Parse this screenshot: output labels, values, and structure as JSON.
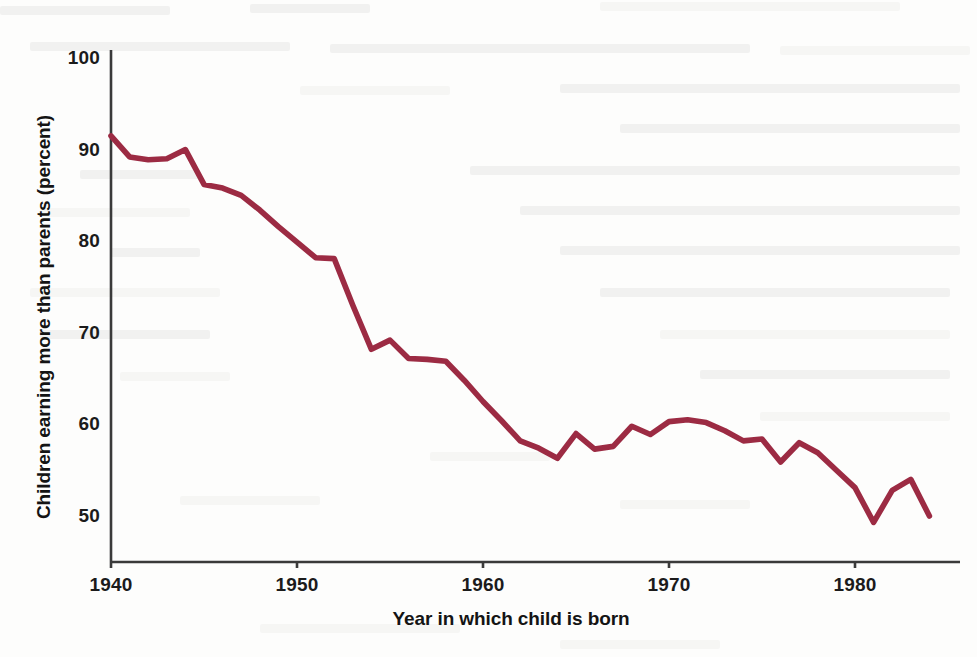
{
  "figure": {
    "background_color": "#fdfdfc",
    "line_color": "#9C2B43",
    "axis_color": "#3a3a3a",
    "text_color": "#141414"
  },
  "axes": {
    "y_ticks": [
      "50",
      "60",
      "70",
      "80",
      "90",
      "100"
    ],
    "x_ticks": [
      "1940",
      "1950",
      "1960",
      "1970",
      "1980"
    ],
    "y_axis_label": "Children earning more than parents (percent)",
    "x_axis_label": "Year in which child is born"
  },
  "chart_data": {
    "type": "line",
    "title": "",
    "subtitle": "",
    "xlabel": "Year in which child is born",
    "ylabel": "Children earning more than parents (percent)",
    "xlim": [
      1940,
      1984
    ],
    "ylim": [
      45,
      102
    ],
    "x_tick_values": [
      1940,
      1950,
      1960,
      1970,
      1980
    ],
    "y_tick_values": [
      50,
      60,
      70,
      80,
      90,
      100
    ],
    "grid": false,
    "legend": null,
    "legend_position": "none",
    "series": [
      {
        "name": "Children earning more than parents",
        "color": "#9C2B43",
        "x": [
          1940,
          1941,
          1942,
          1943,
          1944,
          1945,
          1946,
          1947,
          1948,
          1949,
          1950,
          1951,
          1952,
          1953,
          1954,
          1955,
          1956,
          1957,
          1958,
          1959,
          1960,
          1961,
          1962,
          1963,
          1964,
          1965,
          1966,
          1967,
          1968,
          1969,
          1970,
          1971,
          1972,
          1973,
          1974,
          1975,
          1976,
          1977,
          1978,
          1979,
          1980,
          1981,
          1982,
          1983,
          1984
        ],
        "values": [
          91.5,
          89.2,
          88.9,
          89.0,
          90.0,
          86.2,
          85.8,
          85.0,
          83.4,
          81.6,
          79.9,
          78.2,
          78.1,
          73.0,
          68.2,
          69.2,
          67.2,
          67.1,
          66.9,
          64.8,
          62.5,
          60.4,
          58.2,
          57.4,
          56.3,
          59.0,
          57.3,
          57.6,
          59.8,
          58.9,
          60.3,
          60.5,
          60.2,
          59.3,
          58.2,
          58.4,
          55.9,
          58.0,
          56.9,
          55.0,
          53.1,
          49.3,
          52.8,
          54.0,
          50.0
        ]
      }
    ]
  }
}
